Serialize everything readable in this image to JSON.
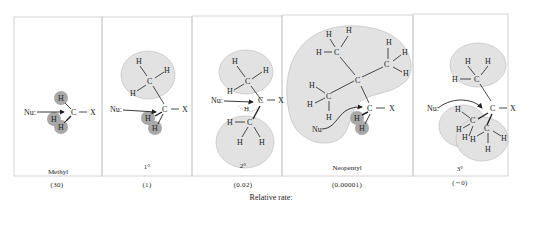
{
  "figure": {
    "caption": "Relative rate:",
    "colors": {
      "panel_border": "#c8c8c8",
      "light_blob": "#e2e2e2",
      "dark_atom": "#a8a8a8",
      "ink": "#222222"
    },
    "atoms": {
      "nucleophile": "Nu:",
      "carbon": "C",
      "hydrogen": "H",
      "leaving_group": "X",
      "bond": "—"
    },
    "panels": [
      {
        "label": "Methyl",
        "rate": "(30)"
      },
      {
        "label": "1°",
        "rate": "(1)"
      },
      {
        "label": "2°",
        "rate": "(0.02)"
      },
      {
        "label": "Neopentyl",
        "rate": "(0.00001)"
      },
      {
        "label": "3°",
        "rate": "(∼0)"
      }
    ]
  }
}
